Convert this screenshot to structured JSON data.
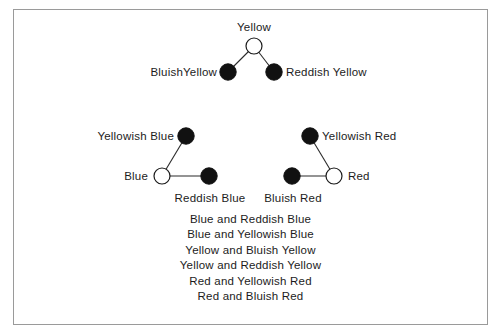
{
  "figure": {
    "background_color": "#ffffff",
    "frame_color": "#9a9a9a",
    "node_stroke_color": "#1a1a1a",
    "node_fill_filled": "#111111",
    "node_fill_open": "#ffffff",
    "edge_color": "#2a2a2a"
  },
  "clusters": [
    {
      "name": "yellow-cluster",
      "center_label": "Yellow",
      "nodes": [
        {
          "id": "yellow",
          "label": "Yellow",
          "type": "open",
          "cx": 254,
          "cy": 46,
          "r": 8,
          "label_pos": "top"
        },
        {
          "id": "bluish-yellow",
          "label": "BluishYellow",
          "type": "filled",
          "cx": 228,
          "cy": 72,
          "r": 8,
          "label_pos": "left"
        },
        {
          "id": "reddish-yellow",
          "label": "Reddish Yellow",
          "type": "filled",
          "cx": 274,
          "cy": 72,
          "r": 8,
          "label_pos": "right"
        }
      ],
      "edges": [
        {
          "from": "yellow",
          "to": "bluish-yellow"
        },
        {
          "from": "yellow",
          "to": "reddish-yellow"
        }
      ]
    },
    {
      "name": "blue-cluster",
      "center_label": "Blue",
      "nodes": [
        {
          "id": "yellowish-blue",
          "label": "Yellowish Blue",
          "type": "filled",
          "cx": 186,
          "cy": 136,
          "r": 8,
          "label_pos": "left"
        },
        {
          "id": "blue",
          "label": "Blue",
          "type": "open",
          "cx": 162,
          "cy": 176,
          "r": 8,
          "label_pos": "left"
        },
        {
          "id": "reddish-blue",
          "label": "Reddish Blue",
          "type": "filled",
          "cx": 209,
          "cy": 176,
          "r": 8,
          "label_pos": "bottom"
        }
      ],
      "edges": [
        {
          "from": "blue",
          "to": "yellowish-blue"
        },
        {
          "from": "blue",
          "to": "reddish-blue"
        }
      ]
    },
    {
      "name": "red-cluster",
      "center_label": "Red",
      "nodes": [
        {
          "id": "yellowish-red",
          "label": "Yellowish Red",
          "type": "filled",
          "cx": 310,
          "cy": 136,
          "r": 8,
          "label_pos": "right"
        },
        {
          "id": "red",
          "label": "Red",
          "type": "open",
          "cx": 334,
          "cy": 176,
          "r": 8,
          "label_pos": "right"
        },
        {
          "id": "bluish-red",
          "label": "Bluish Red",
          "type": "filled",
          "cx": 292,
          "cy": 176,
          "r": 8,
          "label_pos": "bottom"
        }
      ],
      "edges": [
        {
          "from": "red",
          "to": "yellowish-red"
        },
        {
          "from": "red",
          "to": "bluish-red"
        }
      ]
    }
  ],
  "labels": {
    "yellow": "Yellow",
    "bluish_yellow": "BluishYellow",
    "reddish_yellow": "Reddish Yellow",
    "yellowish_blue": "Yellowish Blue",
    "blue": "Blue",
    "reddish_blue": "Reddish Blue",
    "yellowish_red": "Yellowish Red",
    "red": "Red",
    "bluish_red": "Bluish Red"
  },
  "caption": {
    "lines": [
      "Blue and Reddish Blue",
      "Blue and Yellowish Blue",
      "Yellow and Bluish Yellow",
      "Yellow and Reddish Yellow",
      "Red and Yellowish Red",
      "Red and Bluish Red"
    ]
  }
}
